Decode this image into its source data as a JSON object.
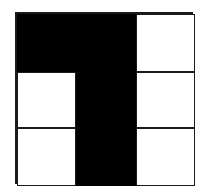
{
  "diagram": {
    "type": "grid",
    "rows": 3,
    "cols": 3,
    "colors": {
      "filled": "#000000",
      "empty": "#ffffff",
      "line": "#1a1a1a"
    },
    "cells": [
      [
        1,
        1,
        0
      ],
      [
        0,
        1,
        0
      ],
      [
        0,
        1,
        0
      ]
    ]
  }
}
